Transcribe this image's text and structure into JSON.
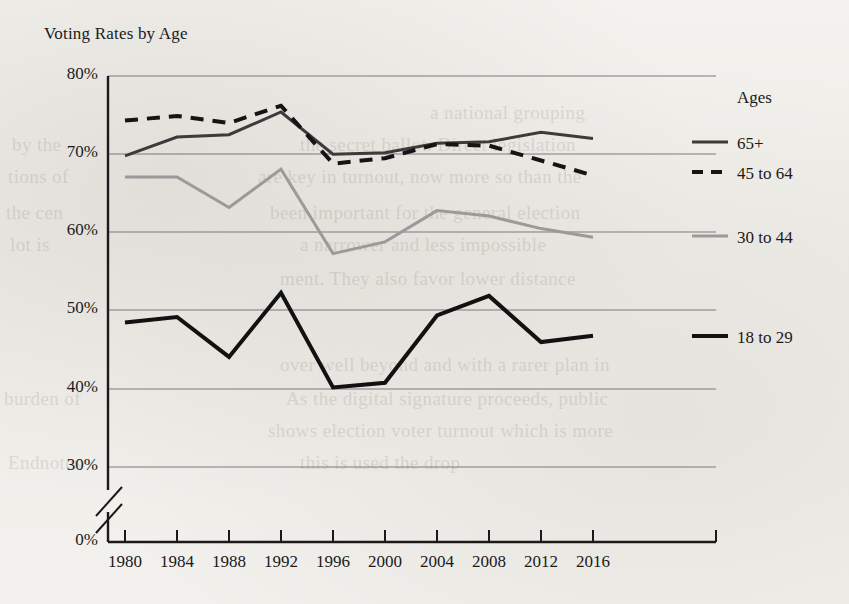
{
  "chart_data": {
    "type": "line",
    "title": "Voting Rates by Age",
    "xlabel": "",
    "ylabel": "",
    "x": [
      1980,
      1984,
      1988,
      1992,
      1996,
      2000,
      2004,
      2008,
      2012,
      2016
    ],
    "categories": [
      "1980",
      "1984",
      "1988",
      "1992",
      "1996",
      "2000",
      "2004",
      "2008",
      "2012",
      "2016"
    ],
    "ylim": [
      0,
      80
    ],
    "y_ticks": [
      0,
      30,
      40,
      50,
      60,
      70,
      80
    ],
    "y_tick_labels": [
      "0%",
      "30%",
      "40%",
      "50%",
      "60%",
      "70%",
      "80%"
    ],
    "y_axis_break": true,
    "y_axis_break_between": [
      0,
      30
    ],
    "grid": true,
    "legend_position": "right",
    "legend_title": "Ages",
    "series": [
      {
        "name": "65+",
        "style": "solid",
        "color": "#3b3b3b",
        "width": 3,
        "values": [
          69.8,
          72.2,
          72.5,
          75.4,
          70.0,
          70.2,
          71.4,
          71.6,
          72.8,
          72.0
        ]
      },
      {
        "name": "45 to 64",
        "style": "dashed",
        "color": "#141414",
        "width": 4,
        "values": [
          74.3,
          74.9,
          74.0,
          76.2,
          68.8,
          69.5,
          71.3,
          71.1,
          69.2,
          67.3
        ]
      },
      {
        "name": "30 to 44",
        "style": "solid",
        "color": "#9a9a9a",
        "width": 3,
        "values": [
          67.1,
          67.1,
          63.2,
          68.1,
          57.3,
          58.8,
          62.8,
          62.1,
          60.5,
          59.4
        ]
      },
      {
        "name": "18 to 29",
        "style": "solid",
        "color": "#111111",
        "width": 4,
        "values": [
          48.5,
          49.2,
          44.1,
          52.3,
          40.2,
          40.8,
          49.4,
          51.9,
          46.0,
          46.8
        ]
      }
    ]
  },
  "legend": {
    "title": "Ages",
    "entries": [
      {
        "label": "65+"
      },
      {
        "label": "45 to 64"
      },
      {
        "label": "30 to 44"
      },
      {
        "label": "18 to 29"
      }
    ]
  },
  "background_text": [
    {
      "text": "a national grouping",
      "x": 430,
      "y": 96
    },
    {
      "text": "the secret ballot. Direct legislation",
      "x": 300,
      "y": 128
    },
    {
      "text": "are key in turnout, now more so than the",
      "x": 258,
      "y": 160
    },
    {
      "text": "been important for the general election",
      "x": 270,
      "y": 196
    },
    {
      "text": "a narrower and less impossible",
      "x": 300,
      "y": 228
    },
    {
      "text": "ment. They also favor lower distance",
      "x": 280,
      "y": 262
    },
    {
      "text": "over well beyond and with a rarer plan in",
      "x": 280,
      "y": 348
    },
    {
      "text": "As the digital signature proceeds, public",
      "x": 286,
      "y": 382
    },
    {
      "text": "shows election voter turnout which is more",
      "x": 268,
      "y": 414
    },
    {
      "text": "this is used the drop",
      "x": 300,
      "y": 446
    },
    {
      "text": "by the",
      "x": 12,
      "y": 128
    },
    {
      "text": "tions of",
      "x": 8,
      "y": 160
    },
    {
      "text": "the cen",
      "x": 6,
      "y": 196
    },
    {
      "text": "lot is",
      "x": 10,
      "y": 228
    },
    {
      "text": "burden of",
      "x": 4,
      "y": 382
    },
    {
      "text": "Endnotes",
      "x": 8,
      "y": 446
    }
  ]
}
